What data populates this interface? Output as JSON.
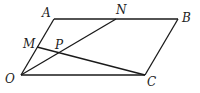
{
  "diagram": {
    "stroke_color": "#1a1a1a",
    "label_color": "#222222",
    "points": {
      "O": {
        "label": "O",
        "x": 21,
        "y": 75,
        "lx": 5,
        "ly": 83
      },
      "A": {
        "label": "A",
        "x": 54,
        "y": 19,
        "lx": 42,
        "ly": 17
      },
      "B": {
        "label": "B",
        "x": 178,
        "y": 19,
        "lx": 182,
        "ly": 22
      },
      "C": {
        "label": "C",
        "x": 145,
        "y": 75,
        "lx": 147,
        "ly": 86
      },
      "N": {
        "label": "N",
        "x": 116,
        "y": 19,
        "lx": 116,
        "ly": 14
      },
      "M": {
        "label": "M",
        "x": 37,
        "y": 47,
        "lx": 23,
        "ly": 48
      },
      "P": {
        "label": "P",
        "x": 59,
        "y": 53,
        "lx": 55,
        "ly": 49
      }
    },
    "segments": [
      {
        "from": "O",
        "to": "A"
      },
      {
        "from": "A",
        "to": "B"
      },
      {
        "from": "B",
        "to": "C"
      },
      {
        "from": "C",
        "to": "O"
      },
      {
        "from": "O",
        "to": "N"
      },
      {
        "from": "M",
        "to": "C"
      }
    ]
  }
}
